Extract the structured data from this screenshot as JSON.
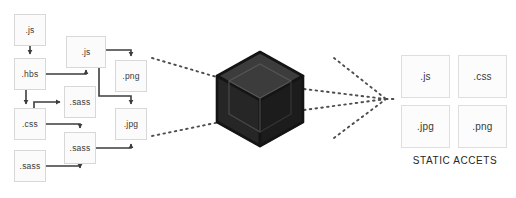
{
  "diagram": {
    "background_color": "#ffffff",
    "source_nodes": [
      {
        "id": "js-top",
        "label": ".js",
        "x": 14,
        "y": 14,
        "w": 32,
        "h": 32
      },
      {
        "id": "js-mid",
        "label": ".js",
        "x": 66,
        "y": 36,
        "w": 40,
        "h": 32
      },
      {
        "id": "hbs",
        "label": ".hbs",
        "x": 14,
        "y": 58,
        "w": 32,
        "h": 32
      },
      {
        "id": "png-src",
        "label": ".png",
        "x": 115,
        "y": 60,
        "w": 32,
        "h": 32
      },
      {
        "id": "sass-up",
        "label": ".sass",
        "x": 64,
        "y": 86,
        "w": 32,
        "h": 32
      },
      {
        "id": "css",
        "label": ".css",
        "x": 14,
        "y": 108,
        "w": 32,
        "h": 32
      },
      {
        "id": "jpg-src",
        "label": ".jpg",
        "x": 115,
        "y": 108,
        "w": 32,
        "h": 32
      },
      {
        "id": "sass-low",
        "label": ".sass",
        "x": 64,
        "y": 132,
        "w": 32,
        "h": 32
      },
      {
        "id": "sass-bot",
        "label": ".sass",
        "x": 14,
        "y": 150,
        "w": 32,
        "h": 32
      }
    ],
    "output_nodes": [
      {
        "id": "out-js",
        "label": ".js",
        "x": 401,
        "y": 55,
        "w": 49,
        "h": 43
      },
      {
        "id": "out-css",
        "label": ".css",
        "x": 458,
        "y": 55,
        "w": 49,
        "h": 43
      },
      {
        "id": "out-jpg",
        "label": ".jpg",
        "x": 401,
        "y": 105,
        "w": 49,
        "h": 43
      },
      {
        "id": "out-png",
        "label": ".png",
        "x": 458,
        "y": 105,
        "w": 49,
        "h": 43
      }
    ],
    "output_caption": "STATIC ACCETS",
    "bundler": {
      "name": "webpack-cube",
      "fill_top": "#3a3a3a",
      "fill_left": "#272727",
      "fill_right": "#1d1d1d",
      "stroke": "#141414"
    },
    "colors": {
      "node_fill": "#fbfbfb",
      "node_border": "#d8d8d8",
      "arrow": "#3d3d3d",
      "dotted": "#4d4d4d",
      "text": "#3a3a3a",
      "caption": "#262626"
    },
    "edges": [
      {
        "from": "js-top",
        "to": "hbs",
        "style": "solid-arrow"
      },
      {
        "from": "hbs",
        "to": "js-mid",
        "style": "solid-arrow"
      },
      {
        "from": "hbs",
        "to": "css",
        "style": "solid-arrow"
      },
      {
        "from": "css",
        "to": "sass-up",
        "style": "solid-arrow"
      },
      {
        "from": "css",
        "to": "sass-low",
        "style": "solid-arrow"
      },
      {
        "from": "sass-bot",
        "to": "sass-low",
        "style": "solid-arrow"
      },
      {
        "from": "js-mid",
        "to": "png-src",
        "style": "solid-arrow"
      },
      {
        "from": "js-mid",
        "to": "jpg-src",
        "style": "solid-arrow"
      },
      {
        "from": "sass-low",
        "to": "jpg-src",
        "style": "solid-arrow"
      },
      {
        "from": "sources",
        "to": "bundler",
        "style": "dotted"
      },
      {
        "from": "bundler",
        "to": "outputs",
        "style": "dotted"
      }
    ]
  }
}
